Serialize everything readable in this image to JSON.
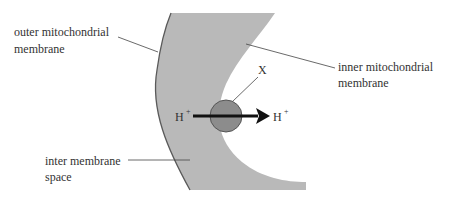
{
  "diagram": {
    "labels": {
      "outer_line1": "outer mitochondrial",
      "outer_line2": "membrane",
      "inner_line1": "inner mitochondrial",
      "inner_line2": "membrane",
      "space_line1": "inter membrane",
      "space_line2": "space",
      "x": "X",
      "h_left": "H",
      "h_right": "H",
      "plus": "+"
    },
    "colors": {
      "membrane_fill": "#b9b9b9",
      "membrane_edge": "#5a5a5a",
      "protein_fill": "#8c8c8c",
      "protein_edge": "#555555",
      "arrow": "#111111",
      "leader": "#444444",
      "text": "#333333"
    }
  }
}
